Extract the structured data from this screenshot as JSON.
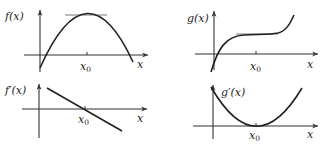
{
  "diagram": {
    "panels": [
      {
        "id": "f",
        "function_label": "f(x)",
        "x_label": "x",
        "point_label": "x",
        "point_subscript": "0",
        "description": "Concave-down parabola with maximum at x0; horizontal tangent line at the peak"
      },
      {
        "id": "g",
        "function_label": "g(x)",
        "x_label": "x",
        "point_label": "x",
        "point_subscript": "0",
        "description": "Increasing cubic with a horizontal inflection (saddle) point at x0; horizontal tangent line there"
      },
      {
        "id": "f-prime",
        "function_label": "f′(x)",
        "x_label": "x",
        "point_label": "x",
        "point_subscript": "0",
        "description": "Decreasing straight line crossing the x-axis at x0"
      },
      {
        "id": "g-prime",
        "function_label": "g′(x)",
        "x_label": "x",
        "point_label": "x",
        "point_subscript": "0",
        "description": "Upward parabola touching the x-axis at its vertex x0"
      }
    ],
    "colors": {
      "curve": "#222222",
      "axis": "#333333",
      "tangent": "#777777",
      "background": "#ffffff"
    }
  }
}
